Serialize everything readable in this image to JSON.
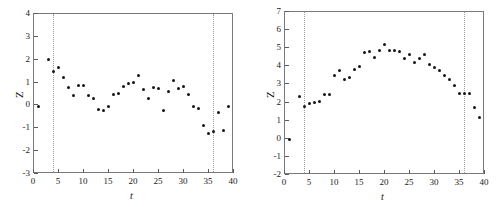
{
  "figure": {
    "panel_count": 2,
    "background_color": "#ffffff",
    "marker_color": "#151515",
    "guide_line_color": "#9b9b9b"
  },
  "chart_data": [
    {
      "type": "scatter",
      "panel": "left",
      "title": "",
      "xlabel": "t",
      "ylabel": "Z",
      "xlim": [
        0,
        40
      ],
      "ylim": [
        -3,
        4
      ],
      "xticks": [
        0,
        5,
        10,
        15,
        20,
        25,
        30,
        35,
        40
      ],
      "yticks": [
        -3,
        -2,
        -1,
        0,
        1,
        2,
        3,
        4
      ],
      "xtick_labels": [
        "0",
        "5",
        "10",
        "15",
        "20",
        "25",
        "30",
        "35",
        "40"
      ],
      "ytick_labels": [
        "-3",
        "-2",
        "-1",
        "0",
        "1",
        "2",
        "3",
        "4"
      ],
      "grid": false,
      "legend": null,
      "annotations": [
        {
          "type": "vline",
          "x": 4,
          "style": "dotted",
          "color": "#9b9b9b"
        },
        {
          "type": "vline",
          "x": 36,
          "style": "dotted",
          "color": "#9b9b9b"
        }
      ],
      "x": [
        1,
        3,
        4,
        5,
        6,
        7,
        8,
        9,
        10,
        11,
        12,
        13,
        14,
        15,
        16,
        17,
        18,
        19,
        20,
        21,
        22,
        23,
        24,
        25,
        26,
        27,
        28,
        29,
        30,
        31,
        32,
        33,
        34,
        35,
        36,
        37,
        38,
        39
      ],
      "y": [
        -0.08,
        1.98,
        1.44,
        1.61,
        1.17,
        0.75,
        0.38,
        0.81,
        0.81,
        0.38,
        0.28,
        -0.21,
        -0.28,
        -0.11,
        0.42,
        0.48,
        0.79,
        0.92,
        0.97,
        1.28,
        0.64,
        0.27,
        0.73,
        0.68,
        -0.28,
        0.58,
        1.04,
        0.72,
        0.8,
        0.42,
        -0.09,
        -0.19,
        -0.93,
        -1.28,
        -1.18,
        -0.34,
        -1.16,
        -0.07
      ]
    },
    {
      "type": "scatter",
      "panel": "right",
      "title": "",
      "xlabel": "t",
      "ylabel": "Z",
      "xlim": [
        0,
        40
      ],
      "ylim": [
        -2,
        7
      ],
      "xticks": [
        0,
        5,
        10,
        15,
        20,
        25,
        30,
        35,
        40
      ],
      "yticks": [
        -2,
        -1,
        0,
        1,
        2,
        3,
        4,
        5,
        6,
        7
      ],
      "xtick_labels": [
        "0",
        "5",
        "10",
        "15",
        "20",
        "25",
        "30",
        "35",
        "40"
      ],
      "ytick_labels": [
        "-2",
        "-1",
        "0",
        "1",
        "2",
        "3",
        "4",
        "5",
        "6",
        "7"
      ],
      "grid": false,
      "legend": null,
      "annotations": [
        {
          "type": "vline",
          "x": 4,
          "style": "dotted",
          "color": "#9b9b9b"
        },
        {
          "type": "vline",
          "x": 36,
          "style": "dotted",
          "color": "#9b9b9b"
        }
      ],
      "x": [
        1,
        3,
        4,
        5,
        6,
        7,
        8,
        9,
        10,
        11,
        12,
        13,
        14,
        15,
        16,
        17,
        18,
        19,
        20,
        21,
        22,
        23,
        24,
        25,
        26,
        27,
        28,
        29,
        30,
        31,
        32,
        33,
        34,
        35,
        36,
        37,
        38,
        39
      ],
      "y": [
        -0.1,
        2.26,
        1.72,
        1.9,
        1.94,
        2.01,
        2.41,
        2.37,
        3.45,
        3.7,
        3.2,
        3.33,
        3.8,
        3.96,
        4.7,
        4.76,
        4.46,
        4.82,
        5.18,
        4.84,
        4.82,
        4.78,
        4.39,
        4.6,
        4.18,
        4.36,
        4.6,
        4.05,
        3.9,
        3.7,
        3.45,
        3.22,
        2.9,
        2.45,
        2.45,
        2.45,
        1.7,
        1.1
      ]
    }
  ]
}
